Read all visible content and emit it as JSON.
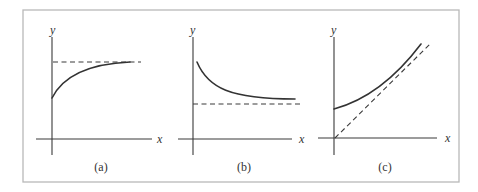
{
  "figure": {
    "frame": {
      "x": 23,
      "y": 10,
      "width": 436,
      "height": 172
    },
    "colors": {
      "ink": "#333333",
      "frame": "#b9b9b9",
      "background": "#ffffff"
    },
    "panels": [
      {
        "id": "a",
        "caption": "(a)",
        "x_label": "x",
        "y_label": "y",
        "description": "Increasing concave curve starting above origin, approaching horizontal dashed asymptote from below",
        "axes": {
          "origin": [
            52,
            139
          ],
          "x_from": 36,
          "x_to": 152,
          "y_from": 155,
          "y_to": 37
        },
        "curve_path": "M52,98 C62,78 85,64 130,62",
        "asymptote_path": "M53,62 L141,62",
        "x_label_pos": [
          157,
          143
        ],
        "y_label_pos": [
          50,
          34
        ],
        "caption_pos": [
          101,
          171
        ]
      },
      {
        "id": "b",
        "caption": "(b)",
        "x_label": "x",
        "y_label": "y",
        "description": "Decreasing convex curve approaching horizontal dashed asymptote from above",
        "axes": {
          "origin": [
            193,
            139
          ],
          "x_from": 178,
          "x_to": 292,
          "y_from": 155,
          "y_to": 37
        },
        "curve_path": "M197,62 C208,88 230,99 295,99",
        "asymptote_path": "M193,104 L303,104",
        "x_label_pos": [
          299,
          143
        ],
        "y_label_pos": [
          190,
          34
        ],
        "caption_pos": [
          244,
          171
        ]
      },
      {
        "id": "c",
        "caption": "(c)",
        "x_label": "x",
        "y_label": "y",
        "description": "Increasing curve starting above origin, approaching diagonal dashed asymptote through origin",
        "axes": {
          "origin": [
            334,
            138
          ],
          "x_from": 318,
          "x_to": 437,
          "y_from": 155,
          "y_to": 37
        },
        "curve_path": "M334,109 C360,102 390,85 421,44",
        "asymptote_path": "M335,138 L430,44",
        "x_label_pos": [
          445,
          142
        ],
        "y_label_pos": [
          331,
          34
        ],
        "caption_pos": [
          385,
          171
        ]
      }
    ]
  }
}
